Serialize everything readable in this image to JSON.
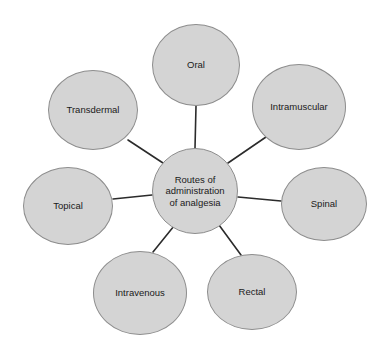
{
  "diagram": {
    "type": "spider-hub-and-spoke",
    "background_color": "#ffffff",
    "node_fill_color": "#d4d4d4",
    "node_border_color": "#8d8d8d",
    "connector_color": "#2b2b2b",
    "text_color": "#1a1a1a",
    "center": {
      "label": "Routes of\nadministration\nof analgesia",
      "label_line1": "Routes of",
      "label_line2": "administration",
      "label_line3": "of analgesia",
      "cx": 195,
      "cy": 191,
      "r": 43
    },
    "satellites": [
      {
        "id": "oral",
        "label": "Oral",
        "cx": 196,
        "cy": 65,
        "rx": 44,
        "ry": 41
      },
      {
        "id": "intramuscular",
        "label": "Intramuscular",
        "cx": 299,
        "cy": 107,
        "rx": 47,
        "ry": 43
      },
      {
        "id": "spinal",
        "label": "Spinal",
        "cx": 324,
        "cy": 204,
        "rx": 43,
        "ry": 37
      },
      {
        "id": "rectal",
        "label": "Rectal",
        "cx": 252,
        "cy": 292,
        "rx": 45,
        "ry": 38
      },
      {
        "id": "intravenous",
        "label": "Intravenous",
        "cx": 140,
        "cy": 293,
        "rx": 47,
        "ry": 42
      },
      {
        "id": "topical",
        "label": "Topical",
        "cx": 68,
        "cy": 206,
        "rx": 45,
        "ry": 39
      },
      {
        "id": "transdermal",
        "label": "Transdermal",
        "cx": 93,
        "cy": 110,
        "rx": 45,
        "ry": 40
      }
    ],
    "connectors": [
      {
        "id": "center-to-oral",
        "x1": 195,
        "y1": 148,
        "x2": 196,
        "y2": 106
      },
      {
        "id": "center-to-intramuscular",
        "x1": 228,
        "y1": 163,
        "x2": 266,
        "y2": 137
      },
      {
        "id": "center-to-spinal",
        "x1": 238,
        "y1": 197,
        "x2": 281,
        "y2": 201
      },
      {
        "id": "center-to-rectal",
        "x1": 219,
        "y1": 225,
        "x2": 241,
        "y2": 255
      },
      {
        "id": "center-to-intravenous",
        "x1": 174,
        "y1": 226,
        "x2": 153,
        "y2": 252
      },
      {
        "id": "center-to-topical",
        "x1": 152,
        "y1": 195,
        "x2": 113,
        "y2": 199
      },
      {
        "id": "center-to-transdermal",
        "x1": 163,
        "y1": 163,
        "x2": 128,
        "y2": 140
      }
    ]
  }
}
